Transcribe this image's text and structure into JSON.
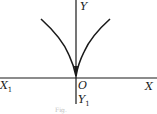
{
  "figure": {
    "type": "cusp-curve",
    "equation_hint": "y = |x|^(2/3)",
    "labels": {
      "y_pos": "Y",
      "y_neg": "Y",
      "y_neg_sub": "1",
      "x_pos": "X",
      "x_neg": "X",
      "x_neg_sub": "1",
      "origin": "O"
    },
    "caption": "Fig.",
    "colors": {
      "stroke": "#1a1a1a",
      "background": "#ffffff"
    }
  }
}
